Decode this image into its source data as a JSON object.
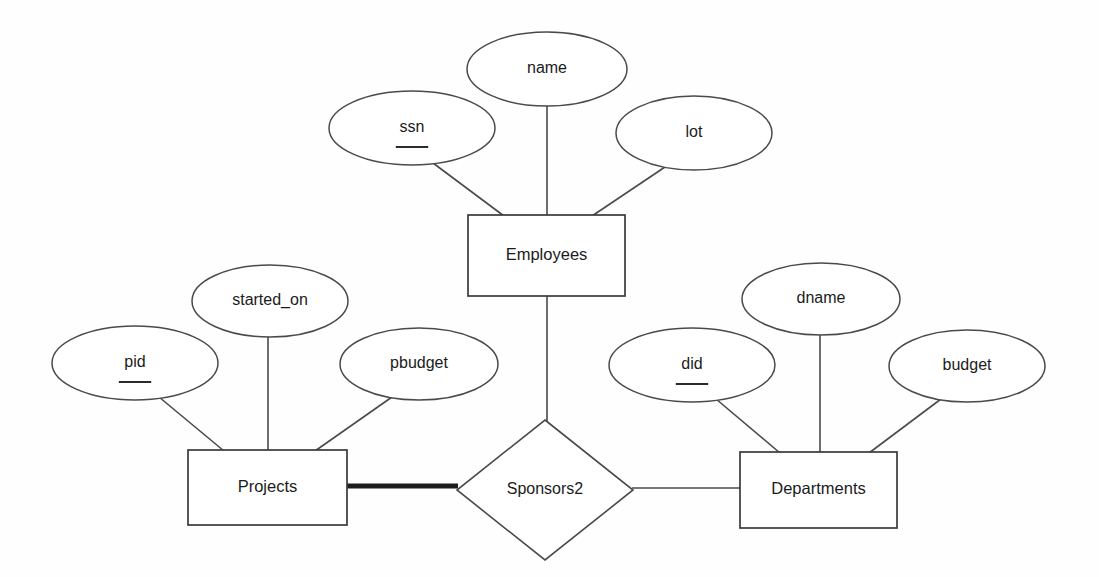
{
  "diagram": {
    "background_color": "#fefefe",
    "line_color": "#4a4a4a",
    "thick_line_color": "#1d1d1d",
    "text_color": "#1b1b1b"
  },
  "entities": [
    {
      "id": "employees",
      "label": "Employees",
      "x": 468,
      "y": 215,
      "w": 157,
      "h": 81
    },
    {
      "id": "projects",
      "label": "Projects",
      "x": 188,
      "y": 450,
      "w": 159,
      "h": 75
    },
    {
      "id": "departments",
      "label": "Departments",
      "x": 740,
      "y": 452,
      "w": 157,
      "h": 76
    }
  ],
  "relationships": [
    {
      "id": "sponsors2",
      "label": "Sponsors2",
      "cx": 545,
      "cy": 490,
      "rx": 88,
      "ry": 70
    }
  ],
  "attributes": [
    {
      "id": "ssn",
      "label": "ssn",
      "cx": 412,
      "cy": 128,
      "rx": 83,
      "ry": 37,
      "is_key": true,
      "owner": "employees"
    },
    {
      "id": "name",
      "label": "name",
      "cx": 547,
      "cy": 69,
      "rx": 80,
      "ry": 37,
      "is_key": false,
      "owner": "employees"
    },
    {
      "id": "lot",
      "label": "lot",
      "cx": 694,
      "cy": 133,
      "rx": 78,
      "ry": 37,
      "is_key": false,
      "owner": "employees"
    },
    {
      "id": "pid",
      "label": "pid",
      "cx": 135,
      "cy": 363,
      "rx": 83,
      "ry": 37,
      "is_key": true,
      "owner": "projects"
    },
    {
      "id": "started_on",
      "label": "started_on",
      "cx": 270,
      "cy": 301,
      "rx": 78,
      "ry": 36,
      "is_key": false,
      "owner": "projects"
    },
    {
      "id": "pbudget",
      "label": "pbudget",
      "cx": 419,
      "cy": 364,
      "rx": 79,
      "ry": 36,
      "is_key": false,
      "owner": "projects"
    },
    {
      "id": "did",
      "label": "did",
      "cx": 692,
      "cy": 365,
      "rx": 83,
      "ry": 37,
      "is_key": true,
      "owner": "departments"
    },
    {
      "id": "dname",
      "label": "dname",
      "cx": 821,
      "cy": 299,
      "rx": 79,
      "ry": 36,
      "is_key": false,
      "owner": "departments"
    },
    {
      "id": "budget",
      "label": "budget",
      "cx": 967,
      "cy": 366,
      "rx": 78,
      "ry": 36,
      "is_key": false,
      "owner": "departments"
    }
  ],
  "edges": [
    {
      "id": "ssn-employees",
      "from": "ssn",
      "to": "employees",
      "x1": 433,
      "y1": 163,
      "x2": 504,
      "y2": 216,
      "thick": false
    },
    {
      "id": "name-employees",
      "from": "name",
      "to": "employees",
      "x1": 547,
      "y1": 106,
      "x2": 547,
      "y2": 216,
      "thick": false
    },
    {
      "id": "lot-employees",
      "from": "lot",
      "to": "employees",
      "x1": 665,
      "y1": 167,
      "x2": 592,
      "y2": 216,
      "thick": false
    },
    {
      "id": "pid-projects",
      "from": "pid",
      "to": "projects",
      "x1": 159,
      "y1": 397,
      "x2": 224,
      "y2": 451,
      "thick": false
    },
    {
      "id": "started_on-projects",
      "from": "started_on",
      "to": "projects",
      "x1": 268,
      "y1": 337,
      "x2": 268,
      "y2": 451,
      "thick": false
    },
    {
      "id": "pbudget-projects",
      "from": "pbudget",
      "to": "projects",
      "x1": 392,
      "y1": 397,
      "x2": 315,
      "y2": 451,
      "thick": false
    },
    {
      "id": "did-departments",
      "from": "did",
      "to": "departments",
      "x1": 716,
      "y1": 399,
      "x2": 780,
      "y2": 453,
      "thick": false
    },
    {
      "id": "dname-departments",
      "from": "dname",
      "to": "departments",
      "x1": 820,
      "y1": 335,
      "x2": 820,
      "y2": 453,
      "thick": false
    },
    {
      "id": "budget-departments",
      "from": "budget",
      "to": "departments",
      "x1": 941,
      "y1": 399,
      "x2": 869,
      "y2": 453,
      "thick": false
    },
    {
      "id": "employees-sponsors2",
      "from": "employees",
      "to": "sponsors2",
      "x1": 547,
      "y1": 296,
      "x2": 547,
      "y2": 421,
      "thick": false
    },
    {
      "id": "projects-sponsors2",
      "from": "projects",
      "to": "sponsors2",
      "x1": 347,
      "y1": 486,
      "x2": 458,
      "y2": 486,
      "thick": true
    },
    {
      "id": "departments-sponsors2",
      "from": "sponsors2",
      "to": "departments",
      "x1": 632,
      "y1": 488,
      "x2": 740,
      "y2": 488,
      "thick": false
    }
  ]
}
